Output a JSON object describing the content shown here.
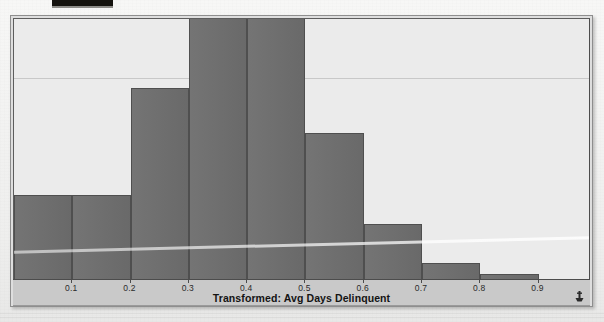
{
  "page": {
    "background_color": "#f3f3f2",
    "frame_color": "#dedede",
    "top_artifact_color": "#15130f"
  },
  "chart_panel": {
    "plot_background": "#ebebeb",
    "axis_strip_background": "#c9c9c9",
    "bar_color": "#6e6e6e",
    "bar_border_color": "#4f4f4f",
    "corner_icon": "anchor-marker-icon"
  },
  "chart_data": {
    "type": "bar",
    "title": "",
    "subtitle": "",
    "xlabel": "Transformed: Avg Days Delinquent",
    "ylabel": "",
    "grid": true,
    "legend": null,
    "legend_position": "none",
    "orientation": "vertical",
    "bin_width": 0.1,
    "xlim": [
      0.0,
      0.99
    ],
    "ylim": [
      0,
      100
    ],
    "xticks": [
      0.1,
      0.2,
      0.3,
      0.4,
      0.5,
      0.6,
      0.7,
      0.8,
      0.9
    ],
    "xtick_labels": [
      "0.1",
      "0.2",
      "0.3",
      "0.4",
      "0.5",
      "0.6",
      "0.7",
      "0.8",
      "0.9"
    ],
    "yticks": [],
    "ytick_labels": [],
    "bin_edges": [
      0.0,
      0.1,
      0.2,
      0.3,
      0.4,
      0.5,
      0.6,
      0.7,
      0.8,
      0.9,
      0.99
    ],
    "bin_labels": [
      "0.0-0.1",
      "0.1-0.2",
      "0.2-0.3",
      "0.3-0.4",
      "0.4-0.5",
      "0.5-0.6",
      "0.6-0.7",
      "0.7-0.8",
      "0.8-0.9",
      "0.9-1.0"
    ],
    "values": [
      32,
      32,
      73,
      104,
      104,
      56,
      21,
      6,
      2,
      0
    ],
    "annotations": [
      {
        "name": "scan-streak",
        "kind": "artifact",
        "description": "pale diagonal scan line"
      },
      {
        "name": "top-black-strip",
        "kind": "artifact",
        "description": "dark block at top edge"
      }
    ]
  }
}
